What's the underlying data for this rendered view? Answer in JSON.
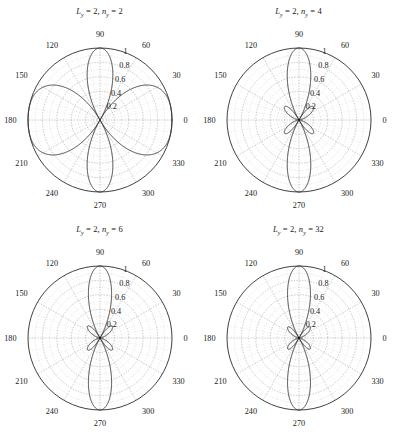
{
  "figure": {
    "background": "#ffffff",
    "curve_color": "#2b2b2b",
    "grid_color": "#9b9b9b",
    "text_color": "#1a1a1a",
    "rows": 2,
    "cols": 2
  },
  "chart_data": [
    {
      "type": "line",
      "plot_style": "polar",
      "title": "L_y = 2, n_y = 2",
      "title_parts": {
        "sym1": "L",
        "sub1": "y",
        "val1": "2",
        "sym2": "n",
        "sub2": "y",
        "val2": "2"
      },
      "xlabel": "",
      "ylabel": "",
      "grid": true,
      "rlim": [
        0,
        1
      ],
      "r_ticks": [
        0.2,
        0.4,
        0.6,
        0.8,
        1
      ],
      "r_tick_labels": [
        "0.2",
        "0.4",
        "0.6",
        "0.8",
        "1"
      ],
      "theta_ticks": [
        0,
        30,
        60,
        90,
        120,
        150,
        180,
        210,
        240,
        270,
        300,
        330
      ],
      "theta_tick_labels": [
        "0",
        "30",
        "60",
        "90",
        "120",
        "150",
        "180",
        "210",
        "240",
        "270",
        "300",
        "330"
      ],
      "theta_direction": "counterclockwise",
      "theta_zero_location": "E",
      "n_y": 2,
      "L_y": 2,
      "series": [
        {
          "name": "normalized array factor",
          "theta_deg": [
            0,
            3,
            6,
            9,
            12,
            15,
            18,
            21,
            24,
            27,
            30,
            33,
            36,
            39,
            42,
            45,
            48,
            51,
            54,
            57,
            60,
            63,
            66,
            69,
            72,
            75,
            78,
            81,
            84,
            87,
            90,
            93,
            96,
            99,
            102,
            105,
            108,
            111,
            114,
            117,
            120,
            123,
            126,
            129,
            132,
            135,
            138,
            141,
            144,
            147,
            150,
            153,
            156,
            159,
            162,
            165,
            168,
            171,
            174,
            177,
            180,
            183,
            186,
            189,
            192,
            195,
            198,
            201,
            204,
            207,
            210,
            213,
            216,
            219,
            222,
            225,
            228,
            231,
            234,
            237,
            240,
            243,
            246,
            249,
            252,
            255,
            258,
            261,
            264,
            267,
            270,
            273,
            276,
            279,
            282,
            285,
            288,
            291,
            294,
            297,
            300,
            303,
            306,
            309,
            312,
            315,
            318,
            321,
            324,
            327,
            330,
            333,
            336,
            339,
            342,
            345,
            348,
            351,
            354,
            357
          ],
          "r": [
            1.0,
            0.997,
            0.989,
            0.975,
            0.956,
            0.931,
            0.902,
            0.867,
            0.829,
            0.786,
            0.74,
            0.691,
            0.639,
            0.586,
            0.531,
            0.476,
            0.42,
            0.365,
            0.311,
            0.259,
            0.209,
            0.162,
            0.119,
            0.08,
            0.047,
            0.02,
            0.021,
            0.064,
            0.118,
            0.178,
            0.24,
            0.3,
            0.357,
            0.408,
            0.451,
            0.484,
            0.506,
            0.516,
            0.514,
            0.5,
            0.475,
            0.44,
            0.397,
            0.348,
            0.296,
            0.242,
            0.189,
            0.138,
            0.092,
            0.052,
            0.02,
            0.013,
            0.058,
            0.134,
            0.222,
            0.316,
            0.413,
            0.51,
            0.603,
            0.69,
            0.766,
            0.83,
            0.882,
            0.921,
            0.947,
            0.962,
            0.966,
            0.96,
            0.945,
            0.921,
            0.89,
            0.852,
            0.809,
            0.761,
            0.709,
            0.654,
            0.597,
            0.539,
            0.481,
            0.424,
            0.369,
            0.317,
            0.269,
            0.226,
            0.189,
            0.16,
            0.14,
            0.131,
            0.131,
            0.14,
            0.155,
            0.175,
            0.196,
            0.216,
            0.233,
            0.246,
            0.253,
            0.254,
            0.248,
            0.237,
            0.221,
            0.201,
            0.179,
            0.156,
            0.133,
            0.112,
            0.095,
            0.083,
            0.078,
            0.082,
            0.096,
            0.12,
            0.155,
            0.2,
            0.256,
            0.32,
            0.391,
            0.468,
            0.548,
            0.629,
            0.709,
            0.785,
            0.854,
            0.914,
            0.961,
            0.99
          ]
        }
      ]
    },
    {
      "type": "line",
      "plot_style": "polar",
      "title": "L_y = 2, n_y = 4",
      "title_parts": {
        "sym1": "L",
        "sub1": "y",
        "val1": "2",
        "sym2": "n",
        "sub2": "y",
        "val2": "4"
      },
      "xlabel": "",
      "ylabel": "",
      "grid": true,
      "rlim": [
        0,
        1
      ],
      "r_ticks": [
        0.2,
        0.4,
        0.6,
        0.8,
        1
      ],
      "r_tick_labels": [
        "0.2",
        "0.4",
        "0.6",
        "0.8",
        "1"
      ],
      "theta_ticks": [
        0,
        30,
        60,
        90,
        120,
        150,
        180,
        210,
        240,
        270,
        300,
        330
      ],
      "theta_tick_labels": [
        "0",
        "30",
        "60",
        "90",
        "120",
        "150",
        "180",
        "210",
        "240",
        "270",
        "300",
        "330"
      ],
      "theta_direction": "counterclockwise",
      "theta_zero_location": "E",
      "n_y": 4,
      "L_y": 2,
      "main_lobe_deg": [
        90,
        270
      ],
      "main_lobe_peak": 1.0,
      "sidelobe_peak": 0.22,
      "sidelobe_count": 6
    },
    {
      "type": "line",
      "plot_style": "polar",
      "title": "L_y = 2, n_y = 6",
      "title_parts": {
        "sym1": "L",
        "sub1": "y",
        "val1": "2",
        "sym2": "n",
        "sub2": "y",
        "val2": "6"
      },
      "xlabel": "",
      "ylabel": "",
      "grid": true,
      "rlim": [
        0,
        1
      ],
      "r_ticks": [
        0.2,
        0.4,
        0.6,
        0.8,
        1
      ],
      "r_tick_labels": [
        "0.2",
        "0.4",
        "0.6",
        "0.8",
        "1"
      ],
      "theta_ticks": [
        0,
        30,
        60,
        90,
        120,
        150,
        180,
        210,
        240,
        270,
        300,
        330
      ],
      "theta_tick_labels": [
        "0",
        "30",
        "60",
        "90",
        "120",
        "150",
        "180",
        "210",
        "240",
        "270",
        "300",
        "330"
      ],
      "theta_direction": "counterclockwise",
      "theta_zero_location": "E",
      "n_y": 6,
      "L_y": 2,
      "main_lobe_deg": [
        90,
        270
      ],
      "main_lobe_peak": 1.0,
      "sidelobe_peak": 0.21,
      "sidelobe_count": 8
    },
    {
      "type": "line",
      "plot_style": "polar",
      "title": "L_y = 2, n_y = 32",
      "title_parts": {
        "sym1": "L",
        "sub1": "y",
        "val1": "2",
        "sym2": "n",
        "sub2": "y",
        "val2": "32"
      },
      "xlabel": "",
      "ylabel": "",
      "grid": true,
      "rlim": [
        0,
        1
      ],
      "r_ticks": [
        0.2,
        0.4,
        0.6,
        0.8,
        1
      ],
      "r_tick_labels": [
        "0.2",
        "0.4",
        "0.6",
        "0.8",
        "1"
      ],
      "theta_ticks": [
        0,
        30,
        60,
        90,
        120,
        150,
        180,
        210,
        240,
        270,
        300,
        330
      ],
      "theta_tick_labels": [
        "0",
        "30",
        "60",
        "90",
        "120",
        "150",
        "180",
        "210",
        "240",
        "270",
        "300",
        "330"
      ],
      "theta_direction": "counterclockwise",
      "theta_zero_location": "E",
      "n_y": 32,
      "L_y": 2,
      "main_lobe_deg": [
        90,
        270
      ],
      "main_lobe_peak": 1.0,
      "sidelobe_peak": 0.2,
      "sidelobe_count": 4
    }
  ]
}
